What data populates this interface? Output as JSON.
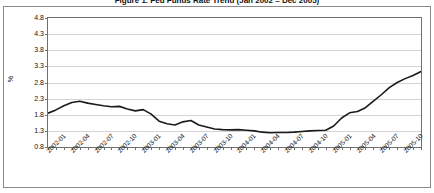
{
  "figure": {
    "title": "Figure 1. Fed Funds Rate Trend (Jan 2002 – Dec 2005)",
    "y_axis_label": "%",
    "line_color": "#1a1a1a",
    "grid_color": "#d4d4d4",
    "frame_color": "#6f6f6f",
    "background": "#ffffff"
  },
  "chart_data": {
    "type": "line",
    "title": "Figure 1. Fed Funds Rate Trend (Jan 2002 – Dec 2005)",
    "xlabel": "",
    "ylabel": "%",
    "ylim": [
      0.8,
      4.8
    ],
    "ytick_labels": [
      "4.8",
      "4.3",
      "3.8",
      "3.3",
      "2.8",
      "2.3",
      "1.8",
      "1.3",
      "0.8"
    ],
    "ytick_values": [
      4.8,
      4.3,
      3.8,
      3.3,
      2.8,
      2.3,
      1.8,
      1.3,
      0.8
    ],
    "grid": true,
    "grid_axis": "y",
    "legend": false,
    "xtick_labels": [
      "2002-01",
      "2002-04",
      "2002-07",
      "2002-10",
      "2003-01",
      "2003-04",
      "2003-07",
      "2003-10",
      "2004-01",
      "2004-04",
      "2004-07",
      "2004-10",
      "2005-01",
      "2005-04",
      "2005-07",
      "2005-10"
    ],
    "x": [
      "2002-01",
      "2002-02",
      "2002-03",
      "2002-04",
      "2002-05",
      "2002-06",
      "2002-07",
      "2002-08",
      "2002-09",
      "2002-10",
      "2002-11",
      "2002-12",
      "2003-01",
      "2003-02",
      "2003-03",
      "2003-04",
      "2003-05",
      "2003-06",
      "2003-07",
      "2003-08",
      "2003-09",
      "2003-10",
      "2003-11",
      "2003-12",
      "2004-01",
      "2004-02",
      "2004-03",
      "2004-04",
      "2004-05",
      "2004-06",
      "2004-07",
      "2004-08",
      "2004-09",
      "2004-10",
      "2004-11",
      "2004-12",
      "2005-01",
      "2005-02",
      "2005-03",
      "2005-04",
      "2005-05",
      "2005-06",
      "2005-07",
      "2005-08",
      "2005-09",
      "2005-10",
      "2005-11",
      "2005-12"
    ],
    "values": [
      1.85,
      1.95,
      2.08,
      2.18,
      2.22,
      2.16,
      2.12,
      2.08,
      2.05,
      2.06,
      1.98,
      1.92,
      1.96,
      1.82,
      1.6,
      1.52,
      1.48,
      1.58,
      1.62,
      1.48,
      1.42,
      1.36,
      1.34,
      1.33,
      1.34,
      1.32,
      1.3,
      1.26,
      1.24,
      1.25,
      1.25,
      1.26,
      1.28,
      1.3,
      1.31,
      1.32,
      1.45,
      1.7,
      1.86,
      1.9,
      2.02,
      2.22,
      2.42,
      2.64,
      2.8,
      2.92,
      3.02,
      3.14
    ],
    "series": [
      {
        "name": "rate",
        "color": "#1a1a1a",
        "values": [
          1.85,
          1.95,
          2.08,
          2.18,
          2.22,
          2.16,
          2.12,
          2.08,
          2.05,
          2.06,
          1.98,
          1.92,
          1.96,
          1.82,
          1.6,
          1.52,
          1.48,
          1.58,
          1.62,
          1.48,
          1.42,
          1.36,
          1.34,
          1.33,
          1.34,
          1.32,
          1.3,
          1.26,
          1.24,
          1.25,
          1.25,
          1.26,
          1.28,
          1.3,
          1.31,
          1.32,
          1.45,
          1.7,
          1.86,
          1.9,
          2.02,
          2.22,
          2.42,
          2.64,
          2.8,
          2.92,
          3.02,
          3.14
        ]
      }
    ],
    "points": [
      {
        "x": "2002-01",
        "y": 1.85
      },
      {
        "x": "2002-02",
        "y": 1.95
      },
      {
        "x": "2002-03",
        "y": 2.08
      },
      {
        "x": "2002-04",
        "y": 2.18
      },
      {
        "x": "2002-05",
        "y": 2.22
      },
      {
        "x": "2002-06",
        "y": 2.16
      },
      {
        "x": "2002-07",
        "y": 2.12
      },
      {
        "x": "2002-08",
        "y": 2.08
      },
      {
        "x": "2002-09",
        "y": 2.05
      },
      {
        "x": "2002-10",
        "y": 2.06
      },
      {
        "x": "2002-11",
        "y": 1.98
      },
      {
        "x": "2002-12",
        "y": 1.92
      },
      {
        "x": "2003-01",
        "y": 1.96
      },
      {
        "x": "2003-02",
        "y": 1.82
      },
      {
        "x": "2003-03",
        "y": 1.6
      },
      {
        "x": "2003-04",
        "y": 1.52
      },
      {
        "x": "2003-05",
        "y": 1.48
      },
      {
        "x": "2003-06",
        "y": 1.58
      },
      {
        "x": "2003-07",
        "y": 1.62
      },
      {
        "x": "2003-08",
        "y": 1.48
      },
      {
        "x": "2003-09",
        "y": 1.42
      },
      {
        "x": "2003-10",
        "y": 1.36
      },
      {
        "x": "2003-11",
        "y": 1.34
      },
      {
        "x": "2003-12",
        "y": 1.33
      },
      {
        "x": "2004-01",
        "y": 1.34
      },
      {
        "x": "2004-02",
        "y": 1.32
      },
      {
        "x": "2004-03",
        "y": 1.3
      },
      {
        "x": "2004-04",
        "y": 1.26
      },
      {
        "x": "2004-05",
        "y": 1.24
      },
      {
        "x": "2004-06",
        "y": 1.25
      },
      {
        "x": "2004-07",
        "y": 1.25
      },
      {
        "x": "2004-08",
        "y": 1.26
      },
      {
        "x": "2004-09",
        "y": 1.28
      },
      {
        "x": "2004-10",
        "y": 1.3
      },
      {
        "x": "2004-11",
        "y": 1.31
      },
      {
        "x": "2004-12",
        "y": 1.32
      },
      {
        "x": "2005-01",
        "y": 1.45
      },
      {
        "x": "2005-02",
        "y": 1.7
      },
      {
        "x": "2005-03",
        "y": 1.86
      },
      {
        "x": "2005-04",
        "y": 1.9
      },
      {
        "x": "2005-05",
        "y": 2.02
      },
      {
        "x": "2005-06",
        "y": 2.22
      },
      {
        "x": "2005-07",
        "y": 2.42
      },
      {
        "x": "2005-08",
        "y": 2.64
      },
      {
        "x": "2005-09",
        "y": 2.8
      },
      {
        "x": "2005-10",
        "y": 2.92
      },
      {
        "x": "2005-11",
        "y": 3.02
      },
      {
        "x": "2005-12",
        "y": 3.14
      }
    ]
  }
}
